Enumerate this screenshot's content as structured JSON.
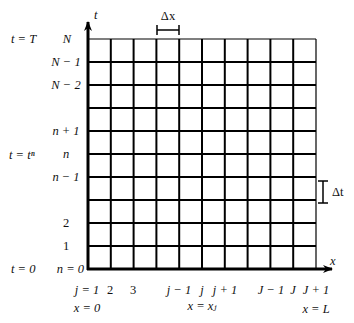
{
  "diagram": {
    "grid": {
      "columns": 10,
      "rows": 10,
      "left": 88,
      "right": 316,
      "top": 39,
      "bottom": 269,
      "line_color": "#000000"
    },
    "axes": {
      "x_label": "x",
      "t_label": "t"
    },
    "annotations": {
      "dx": "Δx",
      "dt": "Δt"
    },
    "time_labels": {
      "t_T": "t = T",
      "t_tn": "t = tⁿ",
      "t_0": "t = 0"
    },
    "n_labels": {
      "N": "N",
      "N_minus_1": "N − 1",
      "N_minus_2": "N − 2",
      "n_plus_1": "n + 1",
      "n": "n",
      "n_minus_1": "n − 1",
      "two": "2",
      "one": "1",
      "n_zero": "n = 0"
    },
    "j_labels": {
      "j1": "j = 1",
      "two": "2",
      "three": "3",
      "j_minus_1": "j − 1",
      "j": "j",
      "j_plus_1": "j + 1",
      "J_minus_1": "J − 1",
      "J": "J",
      "J_plus_1": "J + 1"
    },
    "x_labels": {
      "x0": "x = 0",
      "xj": "x = xⱼ",
      "xL": "x = L"
    }
  }
}
